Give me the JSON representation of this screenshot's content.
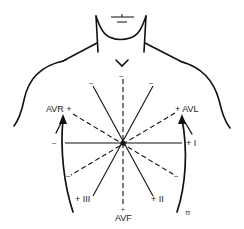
{
  "diagram": {
    "colors": {
      "ink": "#111111",
      "label": "#222222",
      "background": "#ffffff"
    },
    "leads": [
      {
        "name": "I",
        "style": "solid",
        "positive_label": "+ I",
        "negative_label": "−"
      },
      {
        "name": "II",
        "style": "solid",
        "positive_label": "+ II",
        "negative_label": "−"
      },
      {
        "name": "III",
        "style": "solid",
        "positive_label": "+ III",
        "negative_label": "−"
      },
      {
        "name": "AVR",
        "style": "dashed",
        "positive_label": "AVR +",
        "negative_label": "−"
      },
      {
        "name": "AVL",
        "style": "dashed",
        "positive_label": "+ AVL",
        "negative_label": "−"
      },
      {
        "name": "AVF",
        "style": "dashed",
        "positive_label": "AVF",
        "positive_sign": "+",
        "negative_label": "−"
      }
    ],
    "labels": {
      "avr": "AVR +",
      "avl": "+ AVL",
      "lead_i": "+ I",
      "lead_ii": "+ II",
      "lead_iii": "+ III",
      "avf": "AVF",
      "avf_plus": "+",
      "minus": "−",
      "corner_mark": "π"
    },
    "neck_mark": "⊥"
  }
}
